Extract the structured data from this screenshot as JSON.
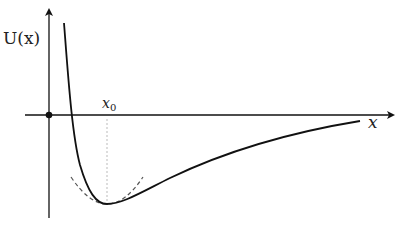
{
  "diagram": {
    "y_axis_label": "U(x)",
    "x_axis_label": "x",
    "equilibrium_label": "x0",
    "equilibrium_label_main": "x",
    "equilibrium_label_sub": "0",
    "colors": {
      "axis": "#111111",
      "curve": "#111111",
      "parabola": "#555555",
      "guide": "#bbbbbb"
    }
  }
}
